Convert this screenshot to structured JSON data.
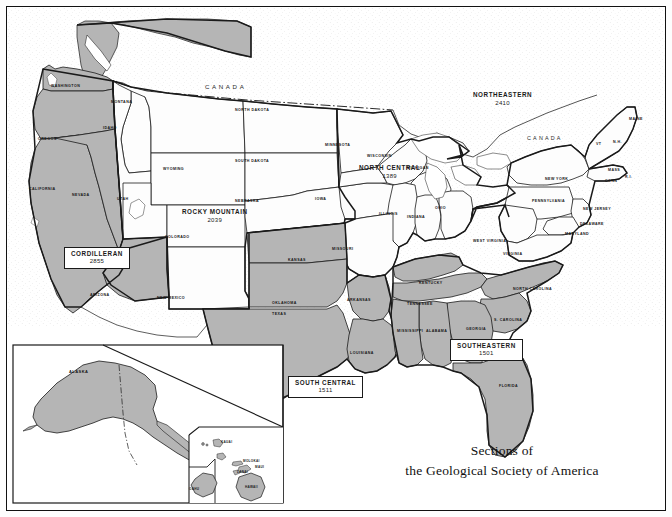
{
  "title": {
    "line1": "Sections of",
    "line2": "the Geological Society of America"
  },
  "countries": [
    {
      "name": "CANADA",
      "id": "canada-west"
    },
    {
      "name": "CANADA",
      "id": "canada-east"
    }
  ],
  "sections": [
    {
      "id": "cordilleran",
      "name": "CORDILLERAN",
      "count": "2855",
      "boxed": true,
      "shaded": true
    },
    {
      "id": "rocky-mountain",
      "name": "ROCKY MOUNTAIN",
      "count": "2039",
      "boxed": false,
      "shaded": false
    },
    {
      "id": "north-central",
      "name": "NORTH CENTRAL",
      "count": "1389",
      "boxed": false,
      "shaded": false
    },
    {
      "id": "northeastern",
      "name": "NORTHEASTERN",
      "count": "2410",
      "boxed": false,
      "shaded": false
    },
    {
      "id": "south-central",
      "name": "SOUTH CENTRAL",
      "count": "1511",
      "boxed": true,
      "shaded": true
    },
    {
      "id": "southeastern",
      "name": "SOUTHEASTERN",
      "count": "1501",
      "boxed": true,
      "shaded": true
    }
  ],
  "states": [
    {
      "name": "WASHINGTON",
      "x": 44,
      "y": 77
    },
    {
      "name": "MONTANA",
      "x": 104,
      "y": 93
    },
    {
      "name": "OREGON",
      "x": 31,
      "y": 130
    },
    {
      "name": "IDAHO",
      "x": 96,
      "y": 119
    },
    {
      "name": "NORTH DAKOTA",
      "x": 228,
      "y": 101
    },
    {
      "name": "SOUTH DAKOTA",
      "x": 228,
      "y": 152
    },
    {
      "name": "WYOMING",
      "x": 156,
      "y": 160
    },
    {
      "name": "NEBRASKA",
      "x": 228,
      "y": 192
    },
    {
      "name": "IOWA",
      "x": 308,
      "y": 190
    },
    {
      "name": "MINNESOTA",
      "x": 318,
      "y": 136
    },
    {
      "name": "WISCONSIN",
      "x": 360,
      "y": 147
    },
    {
      "name": "MICHIGAN",
      "x": 400,
      "y": 159
    },
    {
      "name": "CALIFORNIA",
      "x": 22,
      "y": 180
    },
    {
      "name": "NEVADA",
      "x": 65,
      "y": 186
    },
    {
      "name": "UTAH",
      "x": 110,
      "y": 190
    },
    {
      "name": "COLORADO",
      "x": 158,
      "y": 228
    },
    {
      "name": "MISSOURI",
      "x": 325,
      "y": 240
    },
    {
      "name": "ILLINOIS",
      "x": 372,
      "y": 205
    },
    {
      "name": "INDIANA",
      "x": 400,
      "y": 208
    },
    {
      "name": "OHIO",
      "x": 428,
      "y": 199
    },
    {
      "name": "KANSAS",
      "x": 281,
      "y": 251
    },
    {
      "name": "ARIZONA",
      "x": 83,
      "y": 286
    },
    {
      "name": "NEW MEXICO",
      "x": 150,
      "y": 289
    },
    {
      "name": "OKLAHOMA",
      "x": 265,
      "y": 294
    },
    {
      "name": "TEXAS",
      "x": 265,
      "y": 305
    },
    {
      "name": "ARKANSAS",
      "x": 340,
      "y": 291
    },
    {
      "name": "LOUISIANA",
      "x": 343,
      "y": 344
    },
    {
      "name": "MISSISSIPPI",
      "x": 390,
      "y": 322
    },
    {
      "name": "ALABAMA",
      "x": 419,
      "y": 322
    },
    {
      "name": "TENNESSEE",
      "x": 400,
      "y": 295
    },
    {
      "name": "KENTUCKY",
      "x": 412,
      "y": 274
    },
    {
      "name": "GEORGIA",
      "x": 459,
      "y": 320
    },
    {
      "name": "FLORIDA",
      "x": 492,
      "y": 377
    },
    {
      "name": "S. CAROLINA",
      "x": 487,
      "y": 311
    },
    {
      "name": "NORTH CAROLINA",
      "x": 506,
      "y": 280
    },
    {
      "name": "VIRGINIA",
      "x": 496,
      "y": 245
    },
    {
      "name": "WEST VIRGINIA",
      "x": 466,
      "y": 232
    },
    {
      "name": "PENNSYLVANIA",
      "x": 525,
      "y": 192
    },
    {
      "name": "NEW YORK",
      "x": 538,
      "y": 170
    },
    {
      "name": "MARYLAND",
      "x": 558,
      "y": 225
    },
    {
      "name": "DELAWARE",
      "x": 573,
      "y": 215
    },
    {
      "name": "NEW JERSEY",
      "x": 576,
      "y": 200
    },
    {
      "name": "CONN",
      "x": 598,
      "y": 172
    },
    {
      "name": "R.I.",
      "x": 618,
      "y": 168
    },
    {
      "name": "MASS",
      "x": 601,
      "y": 161
    },
    {
      "name": "VT",
      "x": 589,
      "y": 135
    },
    {
      "name": "N.H.",
      "x": 606,
      "y": 133
    },
    {
      "name": "MAINE",
      "x": 622,
      "y": 110
    }
  ],
  "insets": {
    "alaska": {
      "label": "ALASKA",
      "shaded": true
    },
    "hawaii": {
      "islands": [
        {
          "name": "KAUAI"
        },
        {
          "name": "OAHU"
        },
        {
          "name": "MOLOKAI"
        },
        {
          "name": "MAUI"
        },
        {
          "name": "LANAI"
        },
        {
          "name": "HAWAII"
        }
      ]
    }
  },
  "legend": {
    "shaded_fill": "#b5b5b5",
    "plain_fill": "#ffffff",
    "stipple_fill": "#fbfbfb",
    "line_color": "#1a1a1a"
  }
}
